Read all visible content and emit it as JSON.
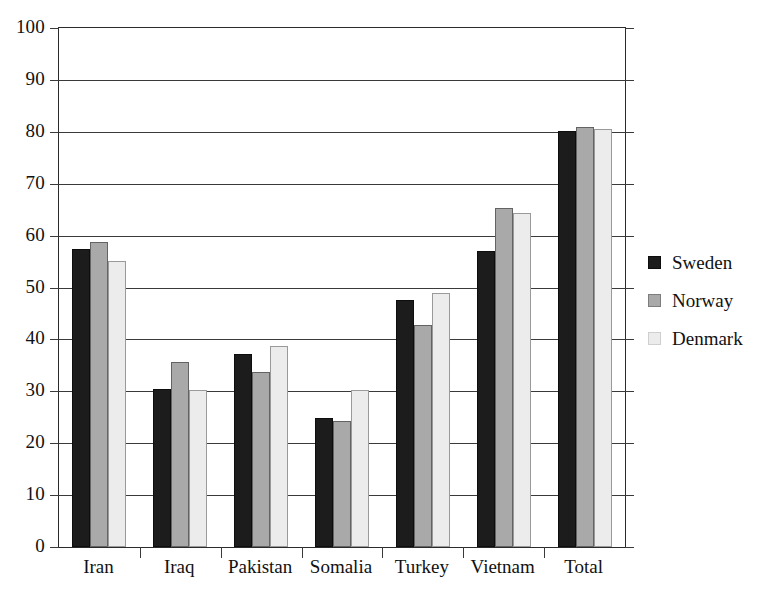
{
  "chart_data": {
    "type": "bar",
    "title": "",
    "subtitle": "",
    "xlabel": "",
    "ylabel": "",
    "ylim": [
      0,
      100
    ],
    "ytick_step": 10,
    "yticks": [
      "0",
      "10",
      "20",
      "30",
      "40",
      "50",
      "60",
      "70",
      "80",
      "90",
      "100"
    ],
    "grid": true,
    "grid_axis": "y",
    "legend_position": "right",
    "categories": [
      "Iran",
      "Iraq",
      "Pakistan",
      "Somalia",
      "Turkey",
      "Vietnam",
      "Total"
    ],
    "series": [
      {
        "name": "Sweden",
        "color": "#1c1c1c",
        "values": [
          57.5,
          30.5,
          37.2,
          24.8,
          47.5,
          57.0,
          80.2
        ]
      },
      {
        "name": "Norway",
        "color": "#a9a9a9",
        "values": [
          58.8,
          35.6,
          33.8,
          24.3,
          42.8,
          65.3,
          81.0
        ]
      },
      {
        "name": "Denmark",
        "color": "#ececec",
        "values": [
          55.2,
          30.2,
          38.8,
          30.2,
          49.0,
          64.3,
          80.5
        ]
      }
    ]
  },
  "legend": {
    "items": [
      {
        "label": "Sweden"
      },
      {
        "label": "Norway"
      },
      {
        "label": "Denmark"
      }
    ]
  },
  "axis": {
    "y_max_label": "100",
    "y_min_label": "0"
  }
}
